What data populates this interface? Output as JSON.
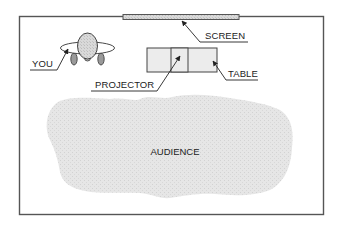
{
  "diagram": {
    "type": "room-layout",
    "labels": {
      "screen": "SCREEN",
      "table": "TABLE",
      "projector": "PROJECTOR",
      "you": "YOU",
      "audience": "AUDIENCE"
    },
    "colors": {
      "border": "#555555",
      "fill_gray": "#d4d4d4",
      "audience_fill": "#e2e2e2",
      "text": "#222222",
      "background": "#ffffff"
    }
  }
}
